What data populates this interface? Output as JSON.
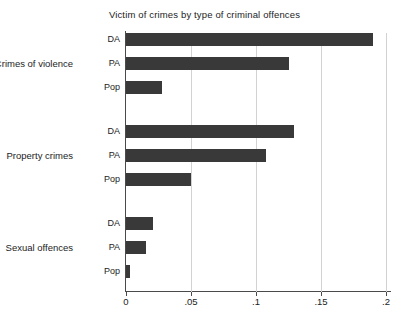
{
  "chart_data": {
    "type": "bar",
    "orientation": "horizontal",
    "title": "Victim of crimes by type of criminal offences",
    "xlabel": "",
    "ylabel": "",
    "xlim": [
      0,
      0.2
    ],
    "grid": true,
    "grid_axis": "x",
    "legend": "none",
    "bar_color": "#393939",
    "axis_color": "#4a4a4a",
    "gridline_color": "#d2d2d2",
    "background": "#ffffff",
    "xticks": [
      0,
      0.05,
      0.1,
      0.15,
      0.2
    ],
    "xtick_labels": [
      "0",
      ".05",
      ".1",
      ".15",
      ".2"
    ],
    "groups": [
      {
        "label": "Crimes of violence",
        "bars": [
          {
            "label": "DA",
            "value": 0.19
          },
          {
            "label": "PA",
            "value": 0.125
          },
          {
            "label": "Pop",
            "value": 0.028
          }
        ]
      },
      {
        "label": "Property crimes",
        "bars": [
          {
            "label": "DA",
            "value": 0.129
          },
          {
            "label": "PA",
            "value": 0.108
          },
          {
            "label": "Pop",
            "value": 0.05
          }
        ]
      },
      {
        "label": "Sexual offences",
        "bars": [
          {
            "label": "DA",
            "value": 0.021
          },
          {
            "label": "PA",
            "value": 0.015
          },
          {
            "label": "Pop",
            "value": 0.003
          }
        ]
      }
    ]
  }
}
